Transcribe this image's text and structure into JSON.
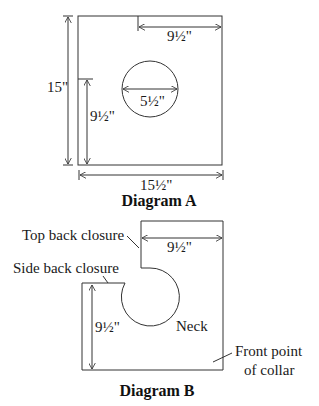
{
  "diagram_a": {
    "title": "Diagram A",
    "dimensions": {
      "height": "15\"",
      "width": "15½\"",
      "top_offset": "9½\"",
      "side_offset": "9½\"",
      "circle_diameter": "5½\""
    }
  },
  "diagram_b": {
    "title": "Diagram B",
    "dimensions": {
      "top_width": "9½\"",
      "side_height": "9½\""
    },
    "labels": {
      "top_back_closure": "Top back closure",
      "side_back_closure": "Side back closure",
      "neck": "Neck",
      "front_point_line1": "Front point",
      "front_point_line2": "of collar"
    }
  }
}
